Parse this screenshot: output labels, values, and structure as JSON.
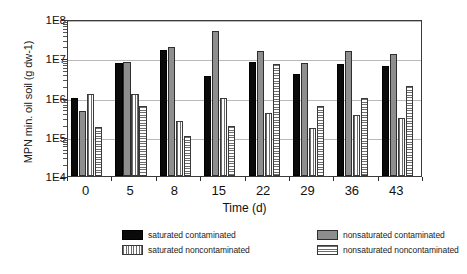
{
  "chart_data": {
    "type": "bar",
    "title": "",
    "xlabel": "Time  (d)",
    "ylabel": "MPN min. oil soil (g dw-1)",
    "categories": [
      "0",
      "5",
      "8",
      "15",
      "22",
      "29",
      "36",
      "43"
    ],
    "yscale": "log",
    "ylim": [
      10000,
      100000000
    ],
    "ytick_labels": [
      "1E4",
      "1E5",
      "1E6",
      "1E7",
      "1E8"
    ],
    "ytick_values": [
      10000,
      100000,
      1000000,
      10000000,
      100000000
    ],
    "grid": "horizontal",
    "legend_position": "bottom",
    "series": [
      {
        "name": "saturated contaminated",
        "pattern": "solid-black",
        "color": "#0a0a0a",
        "values": [
          1000000,
          7500000,
          16000000,
          3500000,
          8000000,
          4000000,
          7000000,
          6500000
        ]
      },
      {
        "name": "nonsaturated contaminated",
        "pattern": "gray-dotted",
        "color": "#8e8e8e",
        "values": [
          450000,
          8000000,
          19000000,
          50000000,
          15000000,
          7500000,
          15000000,
          13000000
        ]
      },
      {
        "name": "saturated noncontaminated",
        "pattern": "vertical-stripes",
        "color": "#6d6d6d",
        "values": [
          1200000,
          1200000,
          250000,
          1000000,
          400000,
          170000,
          350000,
          300000
        ]
      },
      {
        "name": "nonsaturated noncontaminated",
        "pattern": "horizontal-stripes",
        "color": "#6d6d6d",
        "values": [
          180000,
          600000,
          105000,
          190000,
          7000000,
          600000,
          1000000,
          2000000
        ]
      }
    ]
  }
}
